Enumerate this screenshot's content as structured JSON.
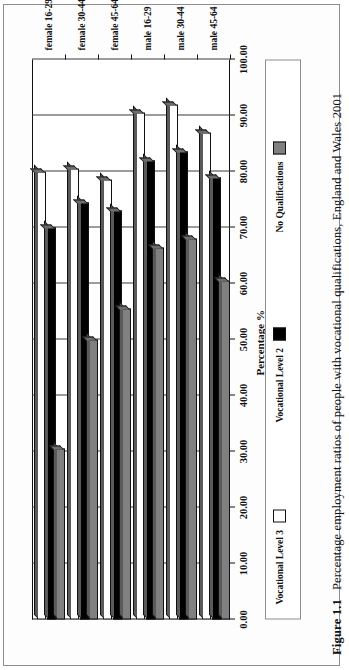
{
  "figure": {
    "number": "Figure 1.1",
    "caption": "Percentage employment ratios of people with vocational qualifications, England and Wales 2001"
  },
  "legend": {
    "items": [
      {
        "label": "Vocational Level 3",
        "color": "#ffffff",
        "name": "legend-vocational-level-3"
      },
      {
        "label": "Vocational Level 2",
        "color": "#000000",
        "name": "legend-vocational-level-2"
      },
      {
        "label": "No Qualifications",
        "color": "#808080",
        "name": "legend-no-qualifications"
      }
    ]
  },
  "chart_data": {
    "type": "bar",
    "orientation": "horizontal",
    "title": "",
    "xlabel": "",
    "ylabel": "Percentage %",
    "ylim": [
      0,
      100
    ],
    "grid": true,
    "legend_position": "bottom",
    "tick_labels": [
      "0.00",
      "10.00",
      "20.00",
      "30.00",
      "40.00",
      "50.00",
      "60.00",
      "70.00",
      "80.00",
      "90.00",
      "100.00"
    ],
    "tick_values": [
      0,
      10,
      20,
      30,
      40,
      50,
      60,
      70,
      80,
      90,
      100
    ],
    "categories": [
      "female 16-29",
      "female 30-44",
      "female 45-64",
      "male 16-29",
      "male 30-44",
      "male 45-64"
    ],
    "series": [
      {
        "name": "Vocational Level 3",
        "color": "#ffffff",
        "values": [
          80.0,
          80.5,
          78.5,
          90.5,
          92.0,
          87.0
        ]
      },
      {
        "name": "Vocational Level 2",
        "color": "#000000",
        "values": [
          70.0,
          74.5,
          73.0,
          82.0,
          83.5,
          79.0
        ]
      },
      {
        "name": "No Qualifications",
        "color": "#808080",
        "values": [
          30.5,
          50.0,
          55.5,
          66.5,
          68.0,
          60.5
        ]
      }
    ]
  }
}
